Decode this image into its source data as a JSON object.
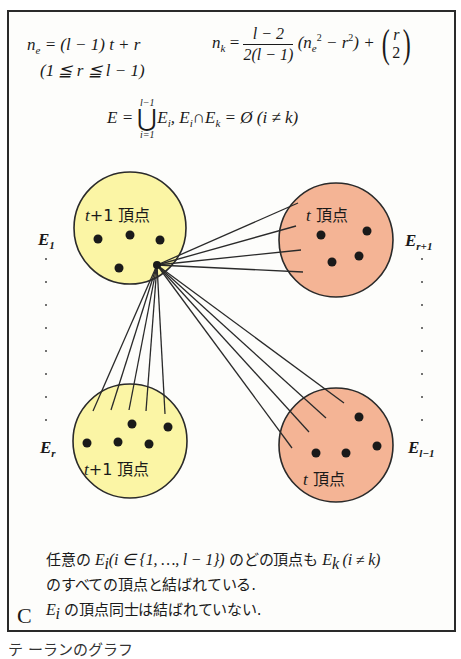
{
  "formulas": {
    "ne_lhs": "n",
    "ne_sub": "e",
    "ne_rhs": " = (l − 1) t + r",
    "constraint": "(1 ≦ r ≦ l − 1)",
    "nk_lhs": "n",
    "nk_sub": "k",
    "nk_eq": " = ",
    "nk_frac_num": "l − 2",
    "nk_frac_den": "2(l − 1)",
    "nk_paren_open": " (n",
    "nk_ne_sub": "e",
    "nk_sq": "2",
    "nk_minus_r": " − r",
    "nk_r_sq": "2",
    "nk_tail": ") + ",
    "binom_top": "r",
    "binom_bottom": "2",
    "union_lhs": "E = ",
    "union_upper": "l−1",
    "union_op": "⋃",
    "union_lower": "i=1",
    "union_term": "E",
    "union_term_sub": "i",
    "disjoint_a": ",   E",
    "disjoint_a_sub": "i",
    "disjoint_cap": "∩E",
    "disjoint_b_sub": "k",
    "disjoint_rhs": " = Ø (i ≠ k)"
  },
  "diagram": {
    "colors": {
      "yellow_fill": "#fbf5a5",
      "salmon_fill": "#f4b495",
      "stroke": "#2a2a2a",
      "vertex": "#1a1a1a"
    },
    "sets": [
      {
        "id": "E1",
        "label": "E",
        "label_sub": "1",
        "caption_var": "t",
        "caption_rest": "+1 頂点",
        "fill": "yellow",
        "vertex_count": 5
      },
      {
        "id": "Er1",
        "label": "E",
        "label_sub": "r+1",
        "caption_var": "t",
        "caption_rest": " 頂点",
        "fill": "salmon",
        "vertex_count": 4
      },
      {
        "id": "Er",
        "label": "E",
        "label_sub": "r",
        "caption_var": "t",
        "caption_rest": "+1 頂点",
        "fill": "yellow",
        "vertex_count": 5
      },
      {
        "id": "El1",
        "label": "E",
        "label_sub": "l−1",
        "caption_var": "t",
        "caption_rest": " 頂点",
        "fill": "salmon",
        "vertex_count": 4
      }
    ]
  },
  "description": {
    "line1_pre": "任意の ",
    "line1_E": "E",
    "line1_E_sub": "i",
    "line1_set": "(i ∈ {1, …, l − 1})",
    "line1_mid": " のどの頂点も ",
    "line1_Ek": "E",
    "line1_Ek_sub": "k",
    "line1_cond": " (i ≠ k)",
    "line2": "のすべての頂点と結ばれている.",
    "line3_E": "E",
    "line3_E_sub": "i",
    "line3_rest": " の頂点同士は結ばれていない."
  },
  "panel_mark": "C",
  "caption_cut": "テ ーランのグラフ"
}
